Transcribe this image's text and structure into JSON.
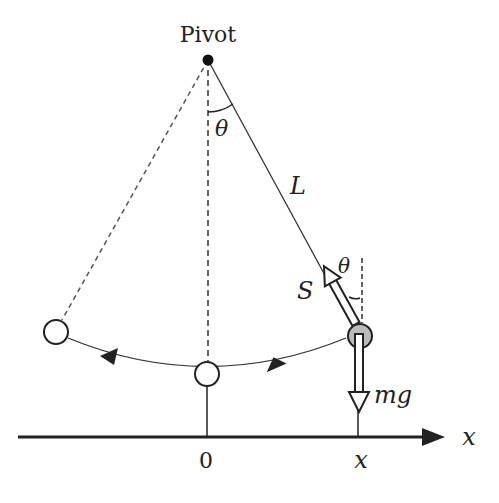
{
  "diagram": {
    "labels": {
      "pivot": "Pivot",
      "theta_top": "θ",
      "length": "L",
      "theta_bob": "θ",
      "tension": "S",
      "weight": "mg",
      "origin": "0",
      "position": "x",
      "axis": "x"
    },
    "colors": {
      "line": "#222222",
      "bob_fill": "#bbbbbb",
      "background": "#ffffff"
    }
  }
}
